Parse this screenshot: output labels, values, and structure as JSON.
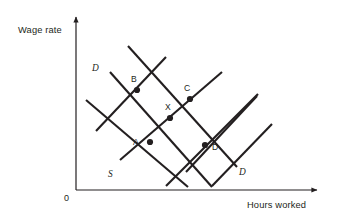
{
  "figure": {
    "type": "economics-supply-demand-lattice",
    "background_color": "#ffffff",
    "ink_color": "#231f20",
    "width": 338,
    "height": 221
  },
  "axes": {
    "y_label": "Wage rate",
    "x_label": "Hours worked",
    "origin_label": "0",
    "y_axis": {
      "x": 76,
      "y_top": 14,
      "y_bottom": 190
    },
    "x_axis": {
      "y": 190,
      "x_left": 76,
      "x_right": 320
    }
  },
  "curve_labels": {
    "demand_upper": "D",
    "demand_lower": "D",
    "supply_lower": "S"
  },
  "points": [
    {
      "id": "B",
      "label": "B",
      "x": 137,
      "y": 90,
      "label_x": 131,
      "label_y": 82
    },
    {
      "id": "C",
      "label": "C",
      "x": 190,
      "y": 99,
      "label_x": 184,
      "label_y": 90
    },
    {
      "id": "X",
      "label": "X",
      "x": 170,
      "y": 118,
      "label_x": 165,
      "label_y": 109
    },
    {
      "id": "A",
      "label": "A",
      "x": 150,
      "y": 142,
      "label_x": 133,
      "label_y": 144
    },
    {
      "id": "D",
      "label": "D",
      "x": 205,
      "y": 145,
      "label_x": 212,
      "label_y": 150
    }
  ],
  "curves": [
    {
      "id": "demand-1",
      "kind": "demand",
      "slope": "downward",
      "x1": 110,
      "y1": 72,
      "x2": 212,
      "y2": 187
    },
    {
      "id": "demand-2",
      "kind": "demand",
      "slope": "downward",
      "x1": 128,
      "y1": 46,
      "x2": 237,
      "y2": 167
    },
    {
      "id": "demand-3",
      "kind": "demand",
      "slope": "downward",
      "x1": 86,
      "y1": 100,
      "x2": 188,
      "y2": 187
    },
    {
      "id": "demand-4",
      "kind": "demand",
      "slope": "downward",
      "x1": 257,
      "y1": 96,
      "x2": 186,
      "y2": 172
    },
    {
      "id": "supply-1",
      "kind": "supply",
      "slope": "upward",
      "x1": 120,
      "y1": 160,
      "x2": 222,
      "y2": 72
    },
    {
      "id": "supply-2",
      "kind": "supply",
      "slope": "upward",
      "x1": 166,
      "y1": 186,
      "x2": 258,
      "y2": 94
    },
    {
      "id": "supply-3",
      "kind": "supply",
      "slope": "upward",
      "x1": 96,
      "y1": 131,
      "x2": 166,
      "y2": 57
    },
    {
      "id": "supply-4",
      "kind": "supply",
      "slope": "upward",
      "x1": 212,
      "y1": 186,
      "x2": 272,
      "y2": 124
    }
  ],
  "curve_label_positions": {
    "demand_upper": {
      "x": 92,
      "y": 71
    },
    "demand_lower": {
      "x": 239,
      "y": 175
    },
    "supply_lower": {
      "x": 108,
      "y": 176
    }
  },
  "axis_label_positions": {
    "y_label": {
      "x": 18,
      "y": 33
    },
    "x_label": {
      "x": 247,
      "y": 207
    },
    "origin": {
      "x": 64,
      "y": 200
    }
  }
}
